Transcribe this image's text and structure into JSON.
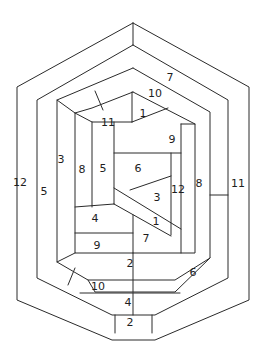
{
  "diagram": {
    "line_color": "#2a2a2a",
    "background": "#ffffff",
    "polylines": [
      {
        "name": "outer-hexagon",
        "points": [
          [
            133,
            23
          ],
          [
            249,
            87
          ],
          [
            249,
            300
          ],
          [
            155,
            340
          ],
          [
            112,
            340
          ],
          [
            17,
            300
          ],
          [
            17,
            87
          ],
          [
            133,
            23
          ]
        ]
      },
      {
        "name": "ring2-hexagon",
        "points": [
          [
            133,
            45
          ],
          [
            228,
            100
          ],
          [
            228,
            278
          ],
          [
            155,
            315
          ],
          [
            112,
            315
          ],
          [
            37,
            278
          ],
          [
            37,
            100
          ],
          [
            133,
            45
          ]
        ]
      },
      {
        "name": "outer-top-divider",
        "points": [
          [
            133,
            23
          ],
          [
            133,
            45
          ]
        ]
      },
      {
        "name": "ring3-outline",
        "points": [
          [
            133,
            68
          ],
          [
            210,
            112
          ],
          [
            210,
            258
          ],
          [
            175,
            280
          ],
          [
            88,
            280
          ],
          [
            57,
            262
          ],
          [
            57,
            100
          ],
          [
            133,
            68
          ]
        ]
      },
      {
        "name": "ring3-left-inner",
        "points": [
          [
            57,
            100
          ],
          [
            75,
            113
          ]
        ]
      },
      {
        "name": "ring3-slash-top",
        "points": [
          [
            95,
            91
          ],
          [
            103,
            110
          ]
        ]
      },
      {
        "name": "inner-outline",
        "points": [
          [
            133,
            92
          ],
          [
            195,
            124
          ],
          [
            195,
            253
          ],
          [
            75,
            253
          ],
          [
            75,
            113
          ],
          [
            92,
            108
          ],
          [
            133,
            92
          ]
        ]
      },
      {
        "name": "inner-right-step",
        "points": [
          [
            181,
            124
          ],
          [
            195,
            124
          ]
        ]
      },
      {
        "name": "inner-right-vert",
        "points": [
          [
            181,
            124
          ],
          [
            181,
            253
          ]
        ]
      },
      {
        "name": "piece11-bottom",
        "points": [
          [
            75,
            113
          ],
          [
            92,
            122
          ],
          [
            132,
            122
          ]
        ]
      },
      {
        "name": "piece1-left",
        "points": [
          [
            132,
            92
          ],
          [
            132,
            122
          ]
        ]
      },
      {
        "name": "piece1-diag",
        "points": [
          [
            132,
            122
          ],
          [
            168,
            108
          ]
        ]
      },
      {
        "name": "piece8-5-divider",
        "points": [
          [
            92,
            122
          ],
          [
            92,
            207
          ]
        ]
      },
      {
        "name": "piece5-right",
        "points": [
          [
            114,
            122
          ],
          [
            114,
            204
          ]
        ]
      },
      {
        "name": "piece9-6-divider",
        "points": [
          [
            114,
            153
          ],
          [
            181,
            153
          ]
        ]
      },
      {
        "name": "piece12-left",
        "points": [
          [
            171,
            153
          ],
          [
            171,
            235
          ]
        ]
      },
      {
        "name": "piece3-top",
        "points": [
          [
            130,
            190
          ],
          [
            171,
            176
          ]
        ]
      },
      {
        "name": "band1-top",
        "points": [
          [
            114,
            188
          ],
          [
            181,
            229
          ]
        ]
      },
      {
        "name": "band1-bottom",
        "points": [
          [
            114,
            204
          ],
          [
            171,
            236
          ]
        ]
      },
      {
        "name": "piece4-top",
        "points": [
          [
            75,
            207
          ],
          [
            114,
            204
          ]
        ]
      },
      {
        "name": "piece4-bottom",
        "points": [
          [
            75,
            233
          ],
          [
            133,
            233
          ]
        ]
      },
      {
        "name": "piece7-left",
        "points": [
          [
            133,
            215
          ],
          [
            133,
            253
          ]
        ]
      },
      {
        "name": "ring3-bottom-line",
        "points": [
          [
            57,
            262
          ],
          [
            75,
            253
          ]
        ]
      },
      {
        "name": "piece2-bottom",
        "points": [
          [
            88,
            280
          ],
          [
            95,
            292
          ],
          [
            175,
            292
          ],
          [
            210,
            258
          ]
        ]
      },
      {
        "name": "piece2-6-divider",
        "points": [
          [
            133,
            253
          ],
          [
            133,
            292
          ]
        ]
      },
      {
        "name": "piece10-slash",
        "points": [
          [
            75,
            268
          ],
          [
            68,
            285
          ]
        ]
      },
      {
        "name": "piece10-bottom",
        "points": [
          [
            80,
            293
          ],
          [
            180,
            293
          ]
        ]
      },
      {
        "name": "piece4b-divider",
        "points": [
          [
            133,
            293
          ],
          [
            133,
            315
          ]
        ]
      },
      {
        "name": "piece-bottom-2-left",
        "points": [
          [
            115,
            315
          ],
          [
            115,
            333
          ]
        ]
      },
      {
        "name": "piece-bottom-2-right",
        "points": [
          [
            152,
            315
          ],
          [
            152,
            333
          ]
        ]
      },
      {
        "name": "right-tick-11",
        "points": [
          [
            210,
            195
          ],
          [
            228,
            195
          ]
        ]
      }
    ],
    "labels": [
      {
        "text": "7",
        "x": 170,
        "y": 77
      },
      {
        "text": "10",
        "x": 155,
        "y": 93
      },
      {
        "text": "11",
        "x": 108,
        "y": 122
      },
      {
        "text": "1",
        "x": 143,
        "y": 113
      },
      {
        "text": "9",
        "x": 172,
        "y": 139
      },
      {
        "text": "3",
        "x": 61,
        "y": 159
      },
      {
        "text": "8",
        "x": 82,
        "y": 169
      },
      {
        "text": "5",
        "x": 103,
        "y": 168
      },
      {
        "text": "6",
        "x": 138,
        "y": 168
      },
      {
        "text": "12",
        "x": 20,
        "y": 182
      },
      {
        "text": "5",
        "x": 44,
        "y": 191
      },
      {
        "text": "12",
        "x": 178,
        "y": 189
      },
      {
        "text": "8",
        "x": 199,
        "y": 183
      },
      {
        "text": "11",
        "x": 238,
        "y": 183
      },
      {
        "text": "3",
        "x": 157,
        "y": 197
      },
      {
        "text": "1",
        "x": 156,
        "y": 221
      },
      {
        "text": "4",
        "x": 95,
        "y": 218
      },
      {
        "text": "7",
        "x": 146,
        "y": 238
      },
      {
        "text": "9",
        "x": 97,
        "y": 245
      },
      {
        "text": "2",
        "x": 130,
        "y": 263
      },
      {
        "text": "6",
        "x": 193,
        "y": 272
      },
      {
        "text": "10",
        "x": 98,
        "y": 286
      },
      {
        "text": "4",
        "x": 128,
        "y": 302
      },
      {
        "text": "2",
        "x": 130,
        "y": 322
      }
    ]
  }
}
